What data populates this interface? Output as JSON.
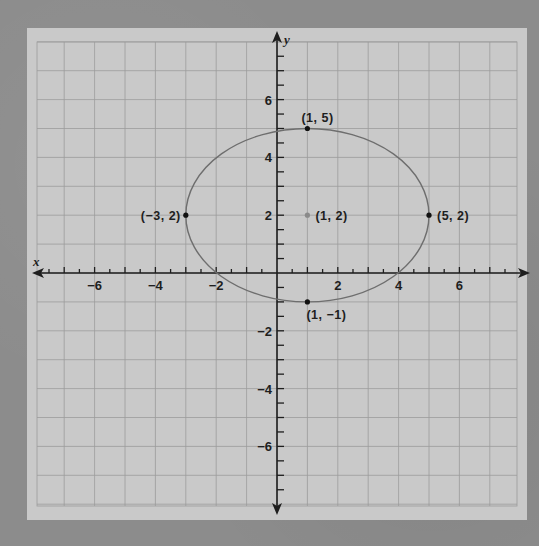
{
  "chart_data": {
    "type": "scatter",
    "title": "",
    "xlabel": "x",
    "ylabel": "y",
    "xlim": [
      -8,
      8
    ],
    "ylim": [
      -8,
      8
    ],
    "grid": true,
    "x_ticks": [
      -6,
      -4,
      -2,
      2,
      4,
      6
    ],
    "y_ticks": [
      6,
      4,
      2,
      -2,
      -4,
      -6
    ],
    "x_tick_labels": [
      "−6",
      "−4",
      "−2",
      "2",
      "4",
      "6"
    ],
    "y_tick_labels": [
      "6",
      "4",
      "2",
      "−2",
      "−4",
      "−6"
    ],
    "curve": {
      "shape": "ellipse",
      "center": [
        1,
        2
      ],
      "semi_axis_x": 4,
      "semi_axis_y": 3,
      "color": "#6e6e6e"
    },
    "points": [
      {
        "x": 1,
        "y": 5,
        "label": "(1, 5)",
        "color": "#111111"
      },
      {
        "x": -3,
        "y": 2,
        "label": "(−3, 2)",
        "color": "#111111"
      },
      {
        "x": 5,
        "y": 2,
        "label": "(5, 2)",
        "color": "#111111"
      },
      {
        "x": 1,
        "y": -1,
        "label": "(1, −1)",
        "color": "#111111"
      },
      {
        "x": 1,
        "y": 2,
        "label": "(1, 2)",
        "color": "#8a8a8a"
      }
    ],
    "legend": null
  },
  "colors": {
    "background": "#8c8c8c",
    "paper": "#c9c9c9",
    "grid": "#9c9c9c",
    "axis": "#1e1e1e",
    "ellipse": "#6e6e6e"
  }
}
